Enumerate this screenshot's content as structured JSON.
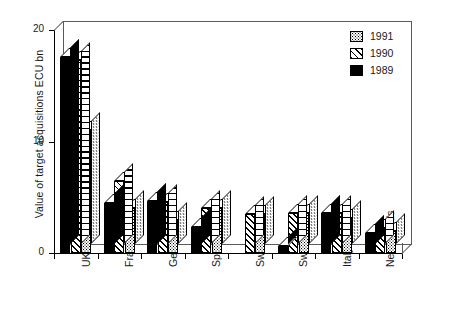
{
  "chart_data": {
    "type": "bar",
    "title": "",
    "xlabel": "",
    "ylabel": "Value of target acquisitions ECU bn",
    "ylim": [
      0,
      20
    ],
    "yticks": [
      0,
      10,
      20
    ],
    "ytick_labels": [
      "0",
      "10",
      "20"
    ],
    "grid": false,
    "legend_position": "top-right",
    "style": "3d-bar",
    "categories": [
      "UK",
      "France",
      "Germany",
      "Spain",
      "Switzerland",
      "Sweden",
      "Italy",
      "Netherlands"
    ],
    "series": [
      {
        "name": "1989",
        "pattern": "solid-black",
        "values": [
          17.6,
          4.5,
          4.7,
          2.3,
          0.0,
          0.6,
          3.6,
          1.8
        ]
      },
      {
        "name": "1990",
        "pattern": "diagonal-hatch",
        "values": [
          17.3,
          6.5,
          4.6,
          4.0,
          3.5,
          3.6,
          3.6,
          2.2
        ]
      },
      {
        "name": "1991",
        "pattern": "dotted-stipple",
        "values": [
          11.0,
          4.0,
          3.0,
          4.0,
          3.5,
          3.6,
          3.1,
          2.0
        ]
      }
    ]
  },
  "legend": {
    "entries": [
      {
        "label": "1991",
        "pattern": "dotted-stipple"
      },
      {
        "label": "1990",
        "pattern": "diagonal-hatch"
      },
      {
        "label": "1989",
        "pattern": "solid-black"
      }
    ]
  },
  "colors": {
    "axis": "#000000",
    "frame": "#5a5a5a",
    "bar_outline": "#000000",
    "background": "#ffffff",
    "text": "#1a1a1a"
  }
}
